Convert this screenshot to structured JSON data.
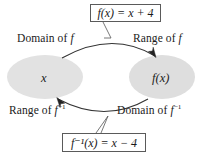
{
  "diagram": {
    "background_color": "#ffffff",
    "ellipse_fill": "#e2e2e2",
    "line_color": "#333333",
    "sets": {
      "left": {
        "element_label": "x",
        "top_label_prefix": "Domain of ",
        "top_label_symbol": "f",
        "top_label_full": "Domain of f",
        "bottom_label_prefix": "Range of ",
        "bottom_label_symbol": "f",
        "bottom_label_superscript": "−1",
        "bottom_label_full": "Range of f⁻¹"
      },
      "right": {
        "element_label": "f(x)",
        "top_label_prefix": "Range of ",
        "top_label_symbol": "f",
        "top_label_full": "Range of f",
        "bottom_label_prefix": "Domain of ",
        "bottom_label_symbol": "f",
        "bottom_label_superscript": "−1",
        "bottom_label_full": "Domain of f⁻¹"
      }
    },
    "arrows": [
      {
        "name": "forward-arrow",
        "direction": "left-to-right",
        "position": "top",
        "describes": "f(x) = x + 4"
      },
      {
        "name": "inverse-arrow",
        "direction": "right-to-left",
        "position": "bottom",
        "describes": "f⁻¹(x) = x − 4"
      }
    ],
    "formula_boxes": {
      "top": {
        "text": "f(x) = x + 4",
        "function_name": "f",
        "argument": "x",
        "expression": "x + 4",
        "operation": "add",
        "constant": 4
      },
      "bottom": {
        "text": "f⁻¹(x) = x − 4",
        "function_name": "f⁻¹",
        "argument": "x",
        "expression": "x − 4",
        "operation": "subtract",
        "constant": 4
      }
    }
  }
}
